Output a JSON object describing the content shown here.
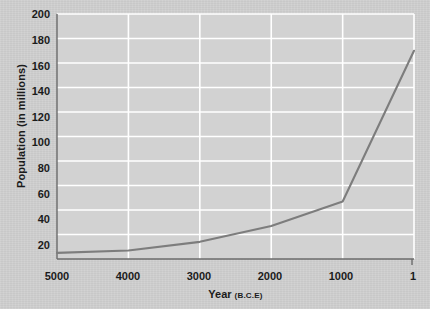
{
  "chart_data": {
    "type": "line",
    "title": "",
    "xlabel": "Year",
    "xlabel_suffix": "(B.C.E)",
    "ylabel": "Population (in millions)",
    "x": [
      5000,
      4000,
      3000,
      2000,
      1000,
      1
    ],
    "values": [
      5,
      7,
      14,
      27,
      47,
      170
    ],
    "series": [
      {
        "name": "World population",
        "values": [
          5,
          7,
          14,
          27,
          47,
          170
        ]
      }
    ],
    "xticks": [
      "5000",
      "4000",
      "3000",
      "2000",
      "1000",
      "1"
    ],
    "xtick_values": [
      5000,
      4000,
      3000,
      2000,
      1000,
      1
    ],
    "yticks": [
      "20",
      "40",
      "60",
      "80",
      "100",
      "120",
      "140",
      "160",
      "180",
      "200"
    ],
    "ytick_values": [
      20,
      40,
      60,
      80,
      100,
      120,
      140,
      160,
      180,
      200
    ],
    "xlim": [
      5000,
      1
    ],
    "ylim": [
      0,
      200
    ],
    "grid": true,
    "legend": "none",
    "line_color": "#7d7d7d",
    "grid_color": "#ffffff",
    "plot_background": "#d2d2d2",
    "axis_color": "#6b6b6b",
    "text_color": "#1b1b1b"
  }
}
